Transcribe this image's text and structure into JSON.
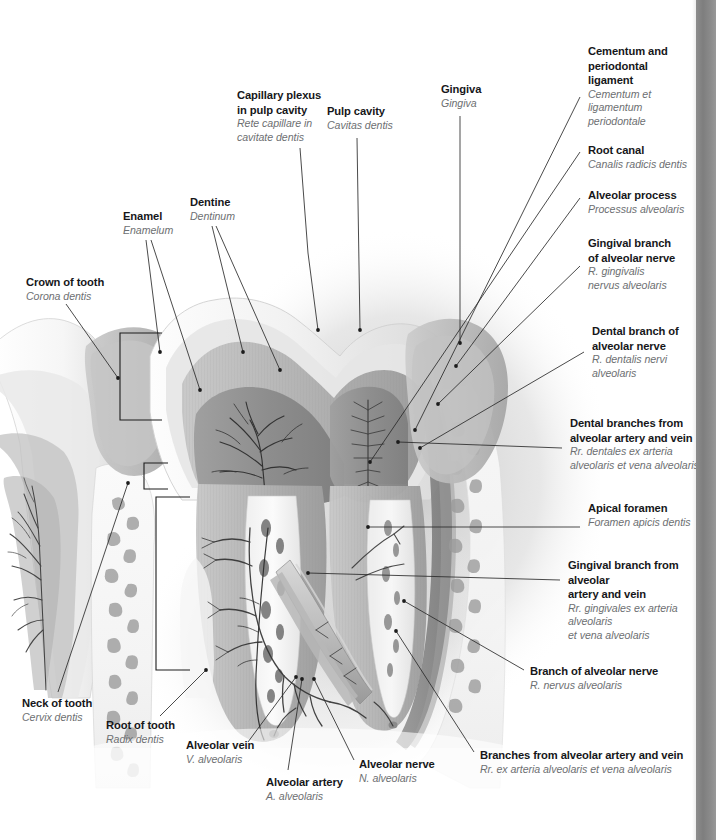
{
  "figure": {
    "kind": "anatomical-illustration",
    "style": "grayscale medical atlas plate",
    "page_edge_bar_color": "#858585",
    "text_colors": {
      "term": "#16171a",
      "latin": "#6d6f72"
    }
  },
  "labels": [
    {
      "id": "capillary-plexus-in-pulp-cavity",
      "term": "Capillary plexus\nin pulp cavity",
      "latin": "Rete capillare in\ncavitate dentis",
      "x": 237,
      "y": 88,
      "align": "left",
      "leaders": [
        [
          [
            300,
            148
          ],
          [
            308,
            253
          ],
          [
            318,
            330
          ]
        ]
      ]
    },
    {
      "id": "pulp-cavity",
      "term": "Pulp cavity",
      "latin": "Cavitas dentis",
      "x": 327,
      "y": 104,
      "align": "left",
      "leaders": [
        [
          [
            357,
            138
          ],
          [
            360,
            330
          ]
        ]
      ]
    },
    {
      "id": "gingiva",
      "term": "Gingiva",
      "latin": "Gingiva",
      "x": 441,
      "y": 82,
      "align": "left",
      "leaders": [
        [
          [
            460,
            116
          ],
          [
            460,
            343
          ]
        ]
      ]
    },
    {
      "id": "cementum-and-periodontal-ligament",
      "term": "Cementum and\nperiodontal\nligament",
      "latin": "Cementum et\nligamentum\nperiodontale",
      "x": 588,
      "y": 44,
      "align": "left",
      "leaders": [
        [
          [
            580,
            97
          ],
          [
            415,
            430
          ]
        ]
      ]
    },
    {
      "id": "root-canal",
      "term": "Root canal",
      "latin": "Canalis radicis dentis",
      "x": 588,
      "y": 143,
      "align": "left",
      "leaders": [
        [
          [
            580,
            152
          ],
          [
            370,
            462
          ]
        ]
      ]
    },
    {
      "id": "alveolar-process",
      "term": "Alveolar process",
      "latin": "Processus alveolaris",
      "x": 588,
      "y": 188,
      "align": "left",
      "leaders": [
        [
          [
            580,
            198
          ],
          [
            456,
            366
          ]
        ]
      ]
    },
    {
      "id": "gingival-branch-of-alveolar-nerve",
      "term": "Gingival branch\nof alveolar nerve",
      "latin": "R. gingivalis\nnervus alveolaris",
      "x": 588,
      "y": 236,
      "align": "left",
      "leaders": [
        [
          [
            580,
            266
          ],
          [
            438,
            404
          ]
        ]
      ]
    },
    {
      "id": "dental-branch-of-alveolar-nerve",
      "term": "Dental branch of\nalveolar nerve",
      "latin": "R. dentalis nervi\nalveolaris",
      "x": 592,
      "y": 324,
      "align": "left",
      "leaders": [
        [
          [
            584,
            352
          ],
          [
            420,
            448
          ]
        ]
      ]
    },
    {
      "id": "dental-branches-from-alveolar-artery-and-vein",
      "term": "Dental branches from\nalveolar artery and vein",
      "latin": "Rr. dentales ex arteria\nalveolaris et vena alveolaris",
      "x": 570,
      "y": 416,
      "align": "left",
      "leaders": [
        [
          [
            562,
            448
          ],
          [
            398,
            442
          ]
        ]
      ]
    },
    {
      "id": "apical-foramen",
      "term": "Apical foramen",
      "latin": "Foramen apicis dentis",
      "x": 588,
      "y": 501,
      "align": "left",
      "leaders": [
        [
          [
            580,
            527
          ],
          [
            368,
            527
          ]
        ]
      ]
    },
    {
      "id": "gingival-branch-from-alveolar-artery-and-vein",
      "term": "Gingival branch from alveolar\nartery and vein",
      "latin": "Rr. gingivales ex arteria alveolaris\net vena alveolaris",
      "x": 568,
      "y": 558,
      "align": "left",
      "leaders": [
        [
          [
            560,
            580
          ],
          [
            308,
            573
          ]
        ]
      ]
    },
    {
      "id": "branch-of-alveolar-nerve",
      "term": "Branch of alveolar nerve",
      "latin": "R. nervus alveolaris",
      "x": 530,
      "y": 664,
      "align": "left",
      "leaders": [
        [
          [
            524,
            670
          ],
          [
            404,
            601
          ]
        ]
      ]
    },
    {
      "id": "branches-from-alveolar-artery-and-vein",
      "term": "Branches from alveolar artery and vein",
      "latin": "Rr. ex arteria alveolaris et vena alveolaris",
      "x": 480,
      "y": 748,
      "align": "left",
      "leaders": [
        [
          [
            474,
            752
          ],
          [
            396,
            631
          ]
        ]
      ]
    },
    {
      "id": "alveolar-nerve",
      "term": "Alveolar nerve",
      "latin": "N. alveolaris",
      "x": 359,
      "y": 757,
      "align": "left",
      "leaders": [
        [
          [
            354,
            760
          ],
          [
            314,
            679
          ]
        ]
      ]
    },
    {
      "id": "alveolar-artery",
      "term": "Alveolar artery",
      "latin": "A. alveolaris",
      "x": 266,
      "y": 775,
      "align": "left",
      "leaders": [
        [
          [
            288,
            770
          ],
          [
            302,
            679
          ]
        ]
      ]
    },
    {
      "id": "alveolar-vein",
      "term": "Alveolar vein",
      "latin": "V. alveolaris",
      "x": 186,
      "y": 738,
      "align": "left",
      "leaders": [
        [
          [
            248,
            742
          ],
          [
            296,
            677
          ]
        ]
      ]
    },
    {
      "id": "root-of-tooth",
      "term": "Root of tooth",
      "latin": "Radix dentis",
      "x": 106,
      "y": 718,
      "align": "left",
      "leaders": [
        [
          [
            160,
            716
          ],
          [
            206,
            670
          ]
        ]
      ]
    },
    {
      "id": "neck-of-tooth",
      "term": "Neck of tooth",
      "latin": "Cervix dentis",
      "x": 22,
      "y": 696,
      "align": "left",
      "leaders": [
        [
          [
            58,
            692
          ],
          [
            128,
            483
          ]
        ]
      ]
    },
    {
      "id": "crown-of-tooth",
      "term": "Crown of tooth",
      "latin": "Corona dentis",
      "x": 26,
      "y": 275,
      "align": "left",
      "leaders": [
        [
          [
            66,
            304
          ],
          [
            118,
            378
          ]
        ]
      ]
    },
    {
      "id": "enamel",
      "term": "Enamel",
      "latin": "Enamelum",
      "x": 123,
      "y": 209,
      "align": "left",
      "leaders": [
        [
          [
            146,
            240
          ],
          [
            160,
            352
          ]
        ],
        [
          [
            151,
            240
          ],
          [
            200,
            390
          ]
        ]
      ]
    },
    {
      "id": "dentine",
      "term": "Dentine",
      "latin": "Dentinum",
      "x": 190,
      "y": 195,
      "align": "left",
      "leaders": [
        [
          [
            212,
            226
          ],
          [
            243,
            352
          ]
        ],
        [
          [
            216,
            226
          ],
          [
            280,
            370
          ]
        ]
      ]
    }
  ],
  "brackets": [
    {
      "id": "bracket-crown",
      "x": 120,
      "y1": 333,
      "y2": 420,
      "arm": 42
    },
    {
      "id": "bracket-neck",
      "x": 144,
      "y1": 463,
      "y2": 489,
      "arm": 24
    },
    {
      "id": "bracket-root",
      "x": 156,
      "y1": 497,
      "y2": 670,
      "arm": 34
    }
  ]
}
